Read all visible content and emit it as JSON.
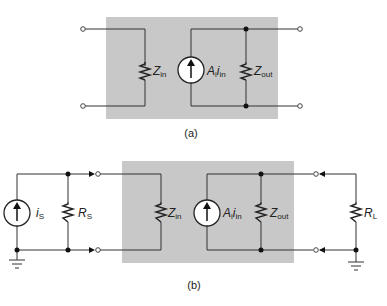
{
  "diagrams": [
    {
      "id": "a",
      "caption": "(a)",
      "components": [
        {
          "type": "resistor",
          "label": "Z",
          "sub": "in"
        },
        {
          "type": "current-source",
          "label_main": "A",
          "label_sub1": "i",
          "label_mid": "i",
          "label_sub2": "in"
        },
        {
          "type": "resistor",
          "label": "Z",
          "sub": "out"
        }
      ]
    },
    {
      "id": "b",
      "caption": "(b)",
      "components": [
        {
          "type": "current-source",
          "label": "i",
          "sub": "S"
        },
        {
          "type": "resistor",
          "label": "R",
          "sub": "S"
        },
        {
          "type": "resistor",
          "label": "Z",
          "sub": "in"
        },
        {
          "type": "current-source",
          "label_main": "A",
          "label_sub1": "i",
          "label_mid": "i",
          "label_sub2": "in"
        },
        {
          "type": "resistor",
          "label": "Z",
          "sub": "out"
        },
        {
          "type": "resistor",
          "label": "R",
          "sub": "L"
        }
      ]
    }
  ],
  "colors": {
    "box": "#c8c8c8",
    "wire": "#333333",
    "background": "#ffffff"
  }
}
